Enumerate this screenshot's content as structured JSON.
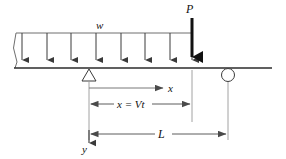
{
  "figure": {
    "colors": {
      "line": "#3a3a3a",
      "beam": "#2b2b2b",
      "dimension": "#6a6a6a",
      "point_load": "#111111",
      "background": "#ffffff"
    }
  },
  "labels": {
    "distributed_load": "w",
    "point_load": "P",
    "x_axis": "x",
    "x_dimension": "x = Vt",
    "span": "L",
    "y_axis": "y"
  },
  "geometry": {
    "beam_line_y": 68,
    "beam_left_x": 14,
    "beam_right_x": 272,
    "load_top_y": 33,
    "load_left_x": 16,
    "load_right_x": 192,
    "pin_support_x": 89,
    "roller_support_x": 228,
    "point_load_x": 192,
    "point_load_top_y": 18,
    "distributed_arrow_count": 8,
    "distributed_arrow_x": [
      22,
      47,
      71,
      96,
      121,
      145,
      170,
      192
    ],
    "dimension_x_y": 88,
    "dimension_xvt_y": 104,
    "dimension_L_y": 134,
    "origin_x": 89
  }
}
